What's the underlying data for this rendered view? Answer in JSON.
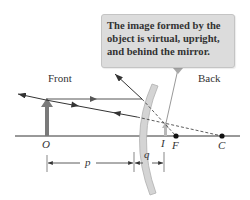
{
  "figure": {
    "type": "convex-mirror-ray-diagram",
    "callout": {
      "lines": [
        "The image formed by the",
        "object is virtual, upright,",
        "and behind the mirror."
      ]
    },
    "regions": {
      "front": "Front",
      "back": "Back"
    },
    "points": {
      "object": "O",
      "image": "I",
      "focal": "F",
      "center": "C"
    },
    "distances": {
      "object_distance": "p",
      "image_distance": "q"
    },
    "colors": {
      "axis": "#333333",
      "ray": "#333333",
      "object_arrow": "#7a7a7a",
      "mirror_fill": "#d4d4d4",
      "mirror_edge": "#b0b0b0",
      "callout_bg": "#dcdcdc",
      "image_arrow": "#b8b8b8"
    }
  }
}
